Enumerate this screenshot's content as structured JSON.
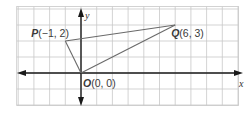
{
  "diagram": {
    "type": "coordinate-plane",
    "grid": {
      "x_range": [
        -4,
        10
      ],
      "y_range": [
        -2,
        4
      ],
      "spacing": 1
    },
    "axes": {
      "x_label": "x",
      "y_label": "y"
    },
    "points": [
      {
        "name": "P",
        "coords": "(−1, 2)",
        "x": -1,
        "y": 2
      },
      {
        "name": "Q",
        "coords": "(6, 3)",
        "x": 6,
        "y": 3
      },
      {
        "name": "O",
        "coords": "(0, 0)",
        "x": 0,
        "y": 0
      }
    ],
    "segments": [
      [
        "O",
        "P"
      ],
      [
        "P",
        "Q"
      ],
      [
        "Q",
        "O"
      ]
    ],
    "colors": {
      "grid": "#c8c8c8",
      "axis": "#1a1a1a",
      "triangle": "#6a6a6a",
      "text": "#3a3a3a"
    }
  }
}
